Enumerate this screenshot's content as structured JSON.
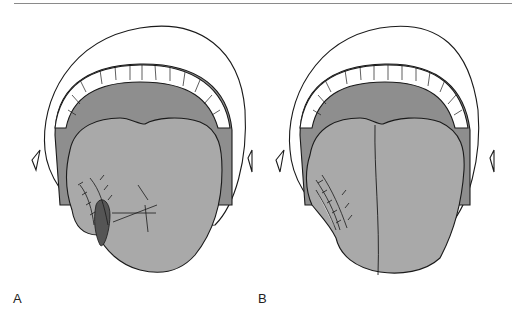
{
  "figure": {
    "panels": [
      {
        "label": "A",
        "description": "Open mouth with tongue; lateral tongue flap with sutures and hatched defect"
      },
      {
        "label": "B",
        "description": "Open mouth with tongue; sutured lateral tongue closure"
      }
    ],
    "colors": {
      "lips": "#ffffff",
      "palate": "#8e8e8e",
      "tongue": "#a9a9a9",
      "teeth": "#ffffff",
      "outline": "#1a1a1a",
      "rule": "#8a8a8a"
    }
  }
}
